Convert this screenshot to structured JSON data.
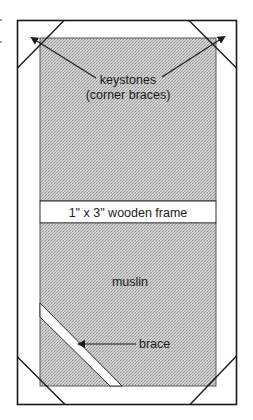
{
  "diagram": {
    "type": "flat-frame-construction",
    "labels": {
      "keystones_line1": "keystones",
      "keystones_line2": "(corner braces)",
      "frame": "1\" x 3\" wooden frame",
      "muslin": "muslin",
      "brace": "brace"
    },
    "colors": {
      "outline": "#1a1a1a",
      "frame_wood": "#ffffff",
      "muslin_fill": "#c4c4c4",
      "muslin_dot": "#9a9a9a"
    }
  }
}
